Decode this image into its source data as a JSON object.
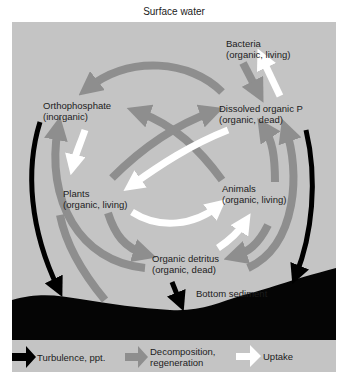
{
  "title": "Surface water",
  "nodes": {
    "bacteria": {
      "name": "Bacteria",
      "desc": "(organic, living)"
    },
    "orthophosphate": {
      "name": "Orthophosphate",
      "desc": "(inorganic)"
    },
    "dissolved": {
      "name": "Dissolved organic P",
      "desc": "(organic, dead)"
    },
    "plants": {
      "name": "Plants",
      "desc": "(organic, living)"
    },
    "animals": {
      "name": "Animals",
      "desc": "(organic, living)"
    },
    "detritus": {
      "name": "Organic detritus",
      "desc": "(organic, dead)"
    },
    "sediment": {
      "name": "Bottom sediment"
    }
  },
  "legend": {
    "turbulence": "Turbulence, ppt.",
    "decomposition_1": "Decomposition,",
    "decomposition_2": "regeneration",
    "uptake": "Uptake"
  },
  "colors": {
    "panel": "#c4c4c4",
    "turbulence_arrow": "#000000",
    "decomposition_arrow": "#8e8e8e",
    "uptake_arrow": "#ffffff",
    "sediment": "#050505"
  }
}
